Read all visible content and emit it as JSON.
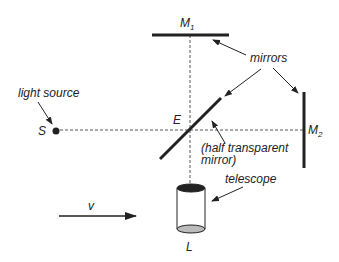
{
  "diagram": {
    "labels": {
      "m1": "M",
      "m1_sub": "1",
      "m2": "M",
      "m2_sub": "2",
      "mirrors": "mirrors",
      "light_source": "light source",
      "source": "S",
      "e": "E",
      "half_line1": "(half transparent",
      "half_line2": "mirror)",
      "telescope": "telescope",
      "l": "L",
      "velocity": "v"
    },
    "colors": {
      "ink": "#222222",
      "dash": "#555555",
      "lens": "#bbbbbb"
    }
  }
}
